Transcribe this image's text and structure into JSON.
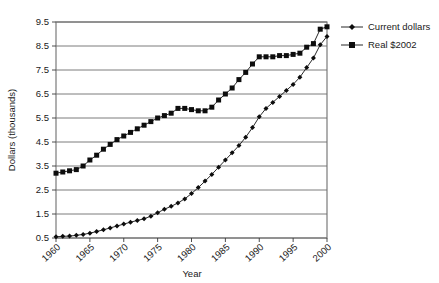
{
  "chart_data": {
    "type": "line",
    "title": "",
    "xlabel": "Year",
    "ylabel": "Dollars (thousands)",
    "xlim": [
      1960,
      2000
    ],
    "ylim": [
      0.5,
      9.5
    ],
    "ytick_step": 1.0,
    "xtick_step": 5,
    "grid": true,
    "legend_position": "right",
    "xticks": [
      "1960",
      "1965",
      "1970",
      "1975",
      "1980",
      "1985",
      "1990",
      "1995",
      "2000"
    ],
    "yticks": [
      "0.5",
      "1.5",
      "2.5",
      "3.5",
      "4.5",
      "5.5",
      "6.5",
      "7.5",
      "8.5",
      "9.5"
    ],
    "x": [
      1960,
      1961,
      1962,
      1963,
      1964,
      1965,
      1966,
      1967,
      1968,
      1969,
      1970,
      1971,
      1972,
      1973,
      1974,
      1975,
      1976,
      1977,
      1978,
      1979,
      1980,
      1981,
      1982,
      1983,
      1984,
      1985,
      1986,
      1987,
      1988,
      1989,
      1990,
      1991,
      1992,
      1993,
      1994,
      1995,
      1996,
      1997,
      1998,
      1999,
      2000
    ],
    "series": [
      {
        "name": "Current dollars",
        "marker": "diamond",
        "values": [
          0.55,
          0.57,
          0.58,
          0.61,
          0.65,
          0.7,
          0.77,
          0.84,
          0.92,
          1.0,
          1.08,
          1.16,
          1.23,
          1.3,
          1.41,
          1.55,
          1.7,
          1.82,
          1.96,
          2.13,
          2.35,
          2.6,
          2.87,
          3.15,
          3.45,
          3.75,
          4.05,
          4.35,
          4.7,
          5.1,
          5.55,
          5.9,
          6.15,
          6.4,
          6.65,
          6.9,
          7.2,
          7.6,
          8.0,
          8.55,
          8.9
        ]
      },
      {
        "name": "Real $2002",
        "marker": "square",
        "values": [
          3.2,
          3.25,
          3.3,
          3.35,
          3.5,
          3.75,
          3.95,
          4.2,
          4.4,
          4.6,
          4.75,
          4.9,
          5.05,
          5.2,
          5.35,
          5.5,
          5.6,
          5.7,
          5.9,
          5.9,
          5.85,
          5.8,
          5.8,
          5.95,
          6.25,
          6.5,
          6.75,
          7.1,
          7.4,
          7.75,
          8.05,
          8.05,
          8.05,
          8.1,
          8.1,
          8.15,
          8.2,
          8.45,
          8.6,
          9.2,
          9.3
        ]
      }
    ]
  },
  "legend": {
    "items": [
      {
        "label": "Current dollars",
        "marker": "diamond"
      },
      {
        "label": "Real $2002",
        "marker": "square"
      }
    ]
  }
}
